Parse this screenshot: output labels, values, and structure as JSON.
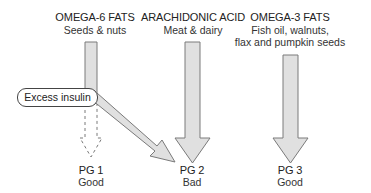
{
  "sources": [
    {
      "title": "OMEGA-6 FATS",
      "subtitle_lines": [
        "Seeds & nuts"
      ]
    },
    {
      "title": "ARACHIDONIC ACID",
      "subtitle_lines": [
        "Meat & dairy"
      ]
    },
    {
      "title": "OMEGA-3 FATS",
      "subtitle_lines": [
        "Fish oil, walnuts,",
        "flax and pumpkin seeds"
      ]
    }
  ],
  "modifier": {
    "label": "Excess insulin"
  },
  "outcomes": [
    {
      "name": "PG 1",
      "quality": "Good"
    },
    {
      "name": "PG 2",
      "quality": "Bad"
    },
    {
      "name": "PG 3",
      "quality": "Good"
    }
  ],
  "colors": {
    "arrow_fill": "#e0e0e0",
    "arrow_stroke": "#7a7a7a",
    "text": "#222222"
  }
}
